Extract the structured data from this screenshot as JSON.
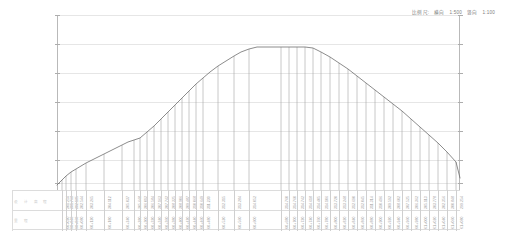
{
  "legend": {
    "label": "比例尺:",
    "horizontal_key": "横向",
    "horizontal_value": "1:500",
    "vertical_key": "竖向",
    "vertical_value": "1:100"
  },
  "table": {
    "row_labels": [
      "设 计 高 程",
      "里        程"
    ]
  },
  "colors": {
    "profile_line": "#6e6e6e",
    "drop_line": "#9a9a9a",
    "gridline": "#e6e6e6",
    "axis": "#b9b9b9",
    "text": "#9b9b9b",
    "background": "#ffffff"
  },
  "chart_data": {
    "type": "line",
    "title": "",
    "subtitle": "",
    "xlabel": "",
    "ylabel": "",
    "grid": true,
    "legend_position": "top-right",
    "axis": {
      "left_axis": true,
      "right_axis": true,
      "gridline_count": 6,
      "gridline_y_px": [
        15,
        44,
        73,
        102,
        131,
        160,
        183
      ],
      "tick_side": "both"
    },
    "annotation": "比例尺: 横向 1:500 竖向 1:100",
    "series": [
      {
        "name": "设计纵断面",
        "x": [
          57,
          62,
          66,
          71,
          76,
          81,
          86,
          92,
          98,
          104,
          110,
          116,
          122,
          128,
          134,
          140,
          147,
          154,
          161,
          168,
          175,
          182,
          189,
          196,
          203,
          210,
          218,
          226,
          234,
          241,
          249,
          257,
          265,
          273,
          281,
          289,
          297,
          305,
          313,
          321,
          330,
          339,
          348,
          357,
          366,
          375,
          384,
          393,
          402,
          411,
          420,
          429,
          438,
          447,
          456,
          460
        ],
        "y": [
          185,
          180,
          176,
          172,
          169,
          166,
          163,
          160,
          157,
          154,
          151,
          148,
          145,
          142,
          140,
          138,
          132,
          126,
          119,
          112,
          105,
          98,
          91,
          84,
          78,
          72,
          66,
          61,
          56,
          52,
          49,
          47,
          47,
          47,
          47,
          47,
          47,
          47,
          48,
          52,
          57,
          63,
          69,
          76,
          83,
          90,
          97,
          104,
          111,
          119,
          127,
          135,
          143,
          152,
          162,
          178
        ]
      }
    ],
    "dropline_x_px": [
      62,
      66,
      71,
      76,
      86,
      104,
      122,
      134,
      140,
      147,
      154,
      161,
      168,
      175,
      182,
      189,
      196,
      203,
      218,
      234,
      249,
      281,
      289,
      297,
      305,
      313,
      321,
      330,
      339,
      348,
      357,
      366,
      375,
      384,
      393,
      402,
      411,
      420,
      429,
      438,
      447,
      456
    ],
    "stations": [
      {
        "chainage": "K0+020",
        "elevation": "301.254"
      },
      {
        "chainage": "K0+040",
        "elevation": "301.768"
      },
      {
        "chainage": "K0+060",
        "elevation": "302.185"
      },
      {
        "chainage": "K0+080",
        "elevation": "302.544"
      },
      {
        "chainage": "K0+120",
        "elevation": "303.265"
      },
      {
        "chainage": "K0+180",
        "elevation": "304.112"
      },
      {
        "chainage": "K0+240",
        "elevation": "305.037"
      },
      {
        "chainage": "K0+280",
        "elevation": "305.648"
      },
      {
        "chainage": "K0+300",
        "elevation": "306.012"
      },
      {
        "chainage": "K0+320",
        "elevation": "306.584"
      },
      {
        "chainage": "K0+340",
        "elevation": "307.163"
      },
      {
        "chainage": "K0+360",
        "elevation": "307.742"
      },
      {
        "chainage": "K0+380",
        "elevation": "308.325"
      },
      {
        "chainage": "K0+400",
        "elevation": "308.906"
      },
      {
        "chainage": "K0+420",
        "elevation": "309.487"
      },
      {
        "chainage": "K0+440",
        "elevation": "310.068"
      },
      {
        "chainage": "K0+460",
        "elevation": "310.649"
      },
      {
        "chainage": "K0+480",
        "elevation": "311.230"
      },
      {
        "chainage": "K0+520",
        "elevation": "312.315"
      },
      {
        "chainage": "K0+560",
        "elevation": "313.284"
      },
      {
        "chainage": "K0+600",
        "elevation": "314.052"
      },
      {
        "chainage": "K0+680",
        "elevation": "314.760"
      },
      {
        "chainage": "K0+700",
        "elevation": "314.760"
      },
      {
        "chainage": "K0+720",
        "elevation": "314.742"
      },
      {
        "chainage": "K0+740",
        "elevation": "314.618"
      },
      {
        "chainage": "K0+760",
        "elevation": "314.405"
      },
      {
        "chainage": "K0+780",
        "elevation": "314.106"
      },
      {
        "chainage": "K0+800",
        "elevation": "313.720"
      },
      {
        "chainage": "K0+820",
        "elevation": "313.248"
      },
      {
        "chainage": "K0+840",
        "elevation": "312.690"
      },
      {
        "chainage": "K0+860",
        "elevation": "312.045"
      },
      {
        "chainage": "K0+880",
        "elevation": "311.314"
      },
      {
        "chainage": "K0+900",
        "elevation": "310.496"
      },
      {
        "chainage": "K0+920",
        "elevation": "309.592"
      },
      {
        "chainage": "K0+940",
        "elevation": "308.602"
      },
      {
        "chainage": "K0+960",
        "elevation": "307.525"
      },
      {
        "chainage": "K0+980",
        "elevation": "306.362"
      },
      {
        "chainage": "K1+000",
        "elevation": "305.113"
      },
      {
        "chainage": "K1+020",
        "elevation": "303.778"
      },
      {
        "chainage": "K1+040",
        "elevation": "302.356"
      },
      {
        "chainage": "K1+060",
        "elevation": "300.848"
      },
      {
        "chainage": "K1+080",
        "elevation": "299.254"
      }
    ]
  }
}
